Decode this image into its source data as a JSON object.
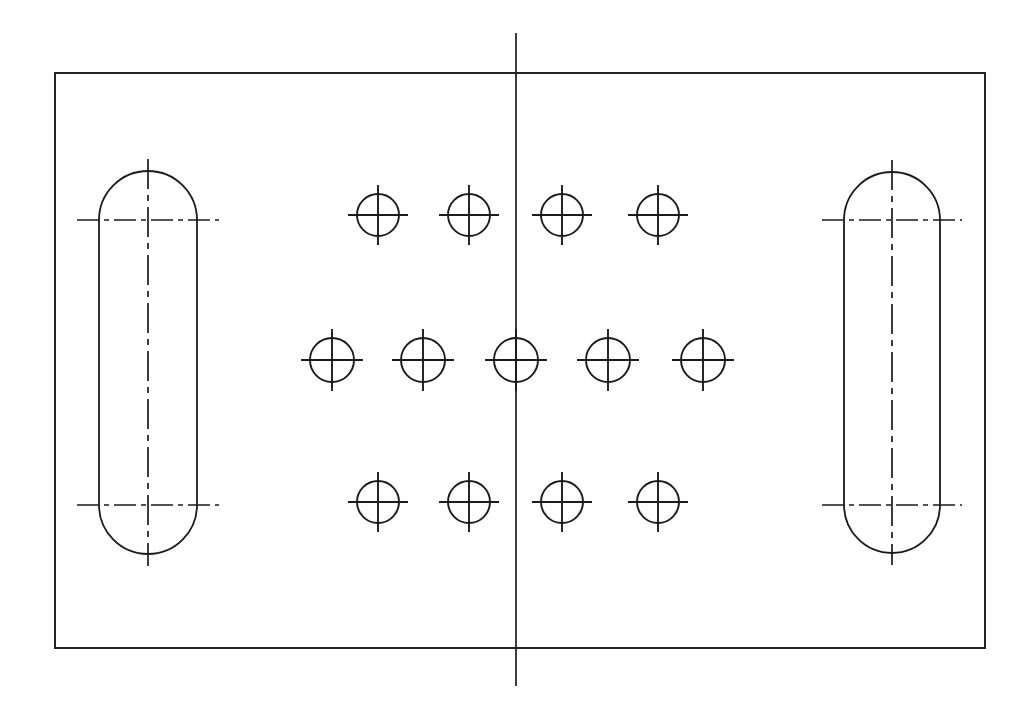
{
  "drawing": {
    "title": "Plate Detail — Hole and Slot Pattern",
    "view_name": "Front View",
    "line_color": "#1b1b1b",
    "background_color": "#ffffff",
    "canvas": {
      "width": 1035,
      "height": 721
    },
    "plate": {
      "name": "plate-outline",
      "shape": "rectangle",
      "x": 55,
      "y": 73,
      "width": 930,
      "height": 575
    },
    "vertical_centerline": {
      "name": "plate-vertical-centerline",
      "x": 516,
      "y_start": 33,
      "y_end": 686
    },
    "slots": [
      {
        "name": "left-obround-slot",
        "center_x": 148,
        "top_center_y": 220,
        "bottom_center_y": 505,
        "radius": 49,
        "body_left_x": 99,
        "body_right_x": 197,
        "centerline_overhang": 22
      },
      {
        "name": "right-obround-slot",
        "center_x": 892,
        "top_center_y": 220,
        "bottom_center_y": 505,
        "radius": 48,
        "body_left_x": 844,
        "body_right_x": 940,
        "centerline_overhang": 22
      }
    ],
    "hole_rows": [
      {
        "name": "top-hole-row",
        "y": 215,
        "count": 4,
        "radius": 21,
        "cross_extent": 30,
        "x_positions": [
          378,
          469,
          562,
          658
        ]
      },
      {
        "name": "middle-hole-row",
        "y": 360,
        "count": 5,
        "radius": 22,
        "cross_extent": 31,
        "x_positions": [
          332,
          423,
          516,
          608,
          703
        ]
      },
      {
        "name": "bottom-hole-row",
        "y": 502,
        "count": 4,
        "radius": 21,
        "cross_extent": 30,
        "x_positions": [
          378,
          469,
          562,
          658
        ]
      }
    ],
    "summary": {
      "total_holes": 13,
      "total_slots": 2,
      "symmetry": "mirrored about vertical centerline"
    }
  }
}
